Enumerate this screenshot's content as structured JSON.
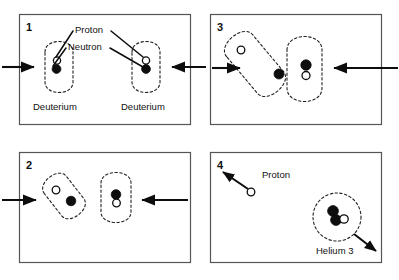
{
  "figure": {
    "colors": {
      "neutron_fill": "#0d0d0d",
      "proton_fill": "#ffffff",
      "outline": "#0d0d0d",
      "frame": "#555555",
      "background": "#ffffff"
    },
    "legend": {
      "proton_label": "Proton",
      "neutron_label": "Neutron"
    },
    "panels": [
      {
        "number": "1",
        "position": "top-left",
        "caption_left": "Deuterium",
        "caption_right": "Deuterium",
        "callouts": [
          "Proton",
          "Neutron"
        ],
        "description": "Two deuterium nuclei approach each other, each containing one proton and one neutron. Motion arrows point inward from both sides."
      },
      {
        "number": "2",
        "position": "bottom-left",
        "callouts": [],
        "description": "The two nuclei are closer together and deformed; the left nucleus is tilted. Motion arrows still point inward."
      },
      {
        "number": "3",
        "position": "top-right",
        "callouts": [],
        "description": "The nuclei touch and begin to merge, envelopes overlapping; nucleons rearrange at the contact point."
      },
      {
        "number": "4",
        "position": "bottom-right",
        "callouts": [
          "Proton",
          "Helium 3"
        ],
        "label_proton": "Proton",
        "label_helium": "Helium 3",
        "description": "Fusion complete: a free proton flies off to the upper left and a Helium 3 nucleus (two protons, one neutron) recoils to the lower right."
      }
    ],
    "particles": {
      "proton_name": "proton",
      "neutron_name": "neutron",
      "proton_style": "open circle",
      "neutron_style": "filled circle"
    }
  }
}
